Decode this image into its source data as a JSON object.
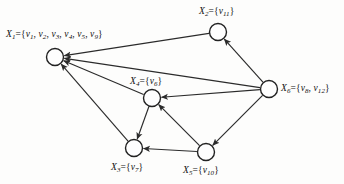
{
  "figure": {
    "type": "directed-graph-diagram",
    "background_color": "#fdfdfc",
    "line_color": "#2b2b2b",
    "node_fill": "#fefefe",
    "node_stroke": "#222222",
    "width": 344,
    "height": 184
  },
  "nodes": [
    {
      "id": "X1",
      "label": "X1={v1, v2, v3, v4, v5, v9}",
      "name": "X",
      "index": "1",
      "members": [
        "v1",
        "v2",
        "v3",
        "v4",
        "v5",
        "v9"
      ],
      "cx": 55,
      "cy": 57,
      "r": 8.5,
      "label_x": 6,
      "label_y": 30
    },
    {
      "id": "X2",
      "label": "X2={v11}",
      "name": "X",
      "index": "2",
      "members": [
        "v11"
      ],
      "cx": 218,
      "cy": 32,
      "r": 8.5,
      "label_x": 199,
      "label_y": 7
    },
    {
      "id": "X3",
      "label": "X3={v7}",
      "name": "X",
      "index": "3",
      "members": [
        "v7"
      ],
      "cx": 134,
      "cy": 148,
      "r": 8.5,
      "label_x": 111,
      "label_y": 163
    },
    {
      "id": "X4",
      "label": "X4={v6}",
      "name": "X",
      "index": "4",
      "members": [
        "v6"
      ],
      "cx": 152,
      "cy": 98,
      "r": 8.5,
      "label_x": 130,
      "label_y": 77
    },
    {
      "id": "X5",
      "label": "X5={v10}",
      "name": "X",
      "index": "5",
      "members": [
        "v10"
      ],
      "cx": 206,
      "cy": 152,
      "r": 8.5,
      "label_x": 183,
      "label_y": 166
    },
    {
      "id": "X6",
      "label": "X6={v8, v12}",
      "name": "X",
      "index": "6",
      "members": [
        "v8",
        "v12"
      ],
      "cx": 269,
      "cy": 89,
      "r": 8.5,
      "label_x": 281,
      "label_y": 84
    }
  ],
  "edges": [
    {
      "from": "X2",
      "to": "X1",
      "directed": true
    },
    {
      "from": "X6",
      "to": "X1",
      "directed": true
    },
    {
      "from": "X4",
      "to": "X1",
      "directed": true
    },
    {
      "from": "X3",
      "to": "X1",
      "directed": true
    },
    {
      "from": "X6",
      "to": "X2",
      "directed": true
    },
    {
      "from": "X6",
      "to": "X4",
      "directed": true
    },
    {
      "from": "X6",
      "to": "X5",
      "directed": true
    },
    {
      "from": "X4",
      "to": "X3",
      "directed": true
    },
    {
      "from": "X5",
      "to": "X4",
      "directed": true
    },
    {
      "from": "X5",
      "to": "X3",
      "directed": true
    }
  ]
}
